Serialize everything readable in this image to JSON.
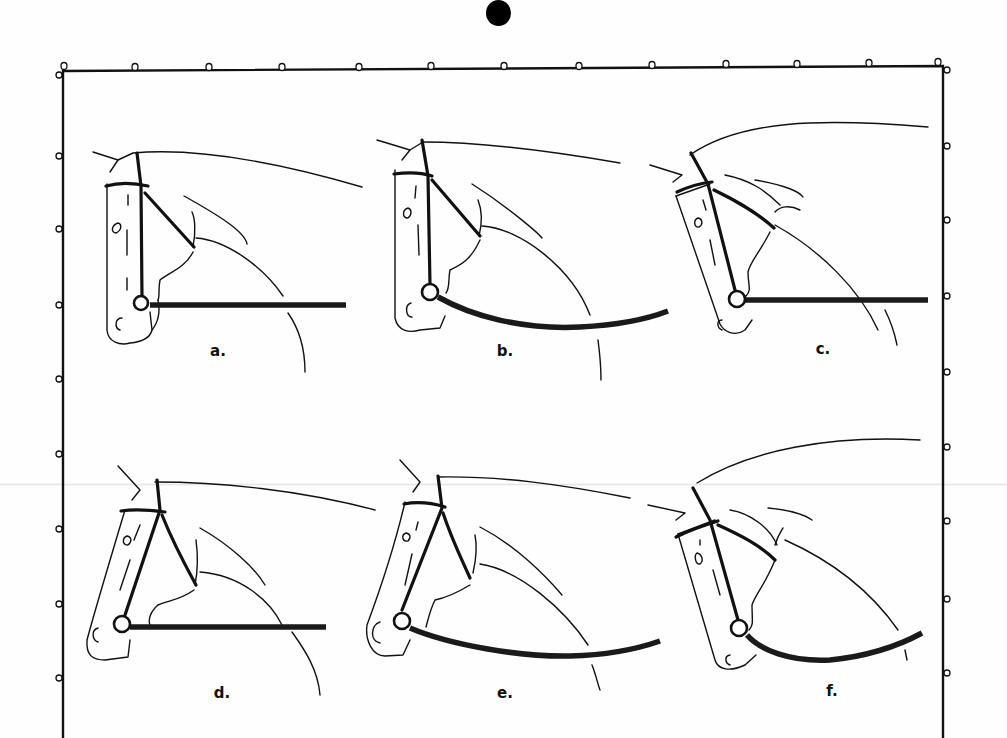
{
  "document": {
    "type": "illustration-plate",
    "subject": "horse head and neck positions with bridle and reins",
    "panels": [
      {
        "id": "a",
        "label": "a.",
        "rein": "straight",
        "head": "vertical"
      },
      {
        "id": "b",
        "label": "b.",
        "rein": "slack",
        "head": "vertical"
      },
      {
        "id": "c",
        "label": "c.",
        "rein": "straight",
        "head": "behind-vertical"
      },
      {
        "id": "d",
        "label": "d.",
        "rein": "straight",
        "head": "in-front-of-vertical"
      },
      {
        "id": "e",
        "label": "e.",
        "rein": "slack",
        "head": "in-front-of-vertical"
      },
      {
        "id": "f",
        "label": "f.",
        "rein": "slack",
        "head": "behind-vertical"
      }
    ]
  },
  "colors": {
    "ink": "#111111",
    "paper": "#fefefe",
    "punch_mark": "#000000"
  },
  "frame": {
    "top_holes": 13,
    "left_holes": 9,
    "right_holes": 9
  }
}
